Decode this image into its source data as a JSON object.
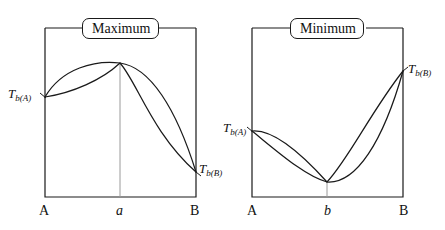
{
  "figure": {
    "type": "diagram",
    "background_color": "#ffffff",
    "line_color": "#1a1a1a",
    "tick_line_color": "#8c8c8c"
  },
  "panels": [
    {
      "id": "maximum",
      "title": "Maximum",
      "frame": {
        "x": 45,
        "y": 28,
        "width": 151,
        "height": 169
      },
      "axis_labels": {
        "left": "A",
        "middle": "a",
        "right": "B"
      },
      "point_labels": {
        "left": "T",
        "left_sub": "b(A)",
        "right": "T",
        "right_sub": "b(B)"
      },
      "extremum": {
        "kind": "maximum",
        "x": 120,
        "y": 63
      },
      "endpoints": {
        "left": {
          "x": 45,
          "y": 97
        },
        "right": {
          "x": 196,
          "y": 172
        }
      }
    },
    {
      "id": "minimum",
      "title": "Minimum",
      "frame": {
        "x": 252,
        "y": 28,
        "width": 151,
        "height": 169
      },
      "axis_labels": {
        "left": "A",
        "middle": "b",
        "right": "B"
      },
      "point_labels": {
        "left": "T",
        "left_sub": "b(A)",
        "right": "T",
        "right_sub": "b(B)"
      },
      "extremum": {
        "kind": "minimum",
        "x": 327,
        "y": 182
      },
      "endpoints": {
        "left": {
          "x": 252,
          "y": 131
        },
        "right": {
          "x": 403,
          "y": 71
        }
      }
    }
  ]
}
